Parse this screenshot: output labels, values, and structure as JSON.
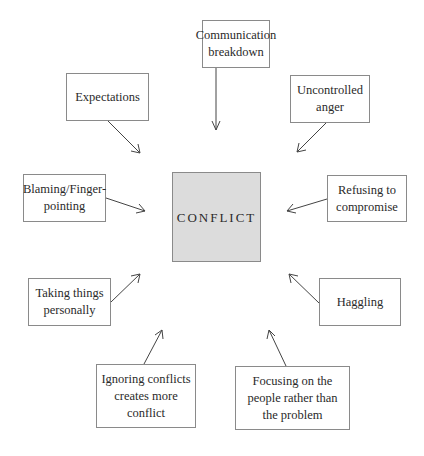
{
  "diagram": {
    "center": {
      "label": "CONFLICT",
      "fill": "#dcdcdc"
    },
    "nodes": [
      {
        "id": "communication",
        "label": "Communication breakdown"
      },
      {
        "id": "expectations",
        "label": "Expectations"
      },
      {
        "id": "anger",
        "label": "Uncontrolled anger"
      },
      {
        "id": "blaming",
        "label": "Blaming/Finger-pointing"
      },
      {
        "id": "refusing",
        "label": "Refusing to compromise"
      },
      {
        "id": "personally",
        "label": "Taking things personally"
      },
      {
        "id": "haggling",
        "label": "Haggling"
      },
      {
        "id": "ignoring",
        "label": "Ignoring conflicts creates more conflict"
      },
      {
        "id": "focusing",
        "label": "Focusing on the people rather than the problem"
      }
    ],
    "edges": [
      {
        "from": "communication",
        "to": "CONFLICT"
      },
      {
        "from": "expectations",
        "to": "CONFLICT"
      },
      {
        "from": "anger",
        "to": "CONFLICT"
      },
      {
        "from": "blaming",
        "to": "CONFLICT"
      },
      {
        "from": "refusing",
        "to": "CONFLICT"
      },
      {
        "from": "personally",
        "to": "CONFLICT"
      },
      {
        "from": "haggling",
        "to": "CONFLICT"
      },
      {
        "from": "ignoring",
        "to": "CONFLICT"
      },
      {
        "from": "focusing",
        "to": "CONFLICT"
      }
    ]
  }
}
